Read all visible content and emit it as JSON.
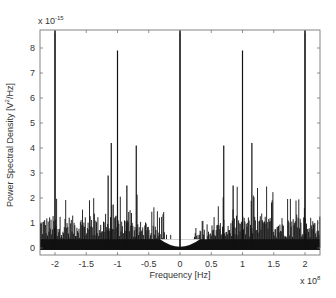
{
  "chart_data": {
    "type": "line",
    "title": "",
    "xlabel": "Frequency [Hz]",
    "ylabel": "Power Spectral Density [V^2/Hz]",
    "x_multiplier": "x 10^8",
    "y_multiplier": "x 10^-15",
    "xlim": [
      -2.2,
      2.25
    ],
    "ylim": [
      0,
      8.7
    ],
    "x_ticks": [
      -2,
      -1.5,
      -1,
      -0.5,
      0,
      0.5,
      1,
      1.5,
      2
    ],
    "x_tick_labels": [
      "-2",
      "-1.5",
      "-1",
      "-0.5",
      "0",
      "0.5",
      "1",
      "1.5",
      "2"
    ],
    "y_ticks": [
      0,
      1,
      2,
      3,
      4,
      5,
      6,
      7,
      8
    ],
    "y_tick_labels": [
      "0",
      "1",
      "2",
      "3",
      "4",
      "5",
      "6",
      "7",
      "8"
    ],
    "grid": false,
    "legend": null,
    "peaks": [
      {
        "x": -2.0,
        "y": 8.7
      },
      {
        "x": -1.15,
        "y": 2.9
      },
      {
        "x": -1.1,
        "y": 4.2
      },
      {
        "x": -1.0,
        "y": 7.9
      },
      {
        "x": -0.85,
        "y": 2.5
      },
      {
        "x": -0.7,
        "y": 4.1
      },
      {
        "x": 0.0,
        "y": 8.7
      },
      {
        "x": 0.7,
        "y": 4.1
      },
      {
        "x": 0.85,
        "y": 2.5
      },
      {
        "x": 1.0,
        "y": 7.9
      },
      {
        "x": 1.15,
        "y": 4.2
      },
      {
        "x": 2.0,
        "y": 8.7
      }
    ],
    "noise_floor_description": "Dense noise spectrum ~0-2.5 (x1e-15) across the band, dipping to ~0 near 0 Hz (roughly |f| < 0.3e8)"
  },
  "labels": {
    "xlabel": "Frequency [Hz]",
    "ylabel_prefix": "Power Spectral Density [V",
    "ylabel_sup": "2",
    "ylabel_suffix": "/Hz]",
    "x_mult_base": "x 10",
    "x_mult_exp": "8",
    "y_mult_base": "x 10",
    "y_mult_exp": "-15"
  },
  "colors": {
    "line": "#111111",
    "axis": "#555555",
    "background": "#ffffff"
  }
}
